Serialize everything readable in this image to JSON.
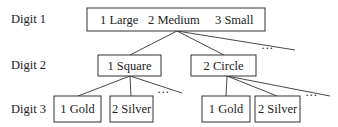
{
  "levels": [
    {
      "label": "Digit 1"
    },
    {
      "label": "Digit 2"
    },
    {
      "label": "Digit 3"
    }
  ],
  "digit1_box": {
    "items": [
      "1 Large",
      "2 Medium",
      "3 Small"
    ]
  },
  "digit2_boxes": [
    "1 Square",
    "2 Circle"
  ],
  "digit3_groups": [
    {
      "items": [
        "1 Gold",
        "2 Silver"
      ]
    },
    {
      "items": [
        "1 Gold",
        "2 Silver"
      ]
    }
  ],
  "ellipsis": "···"
}
